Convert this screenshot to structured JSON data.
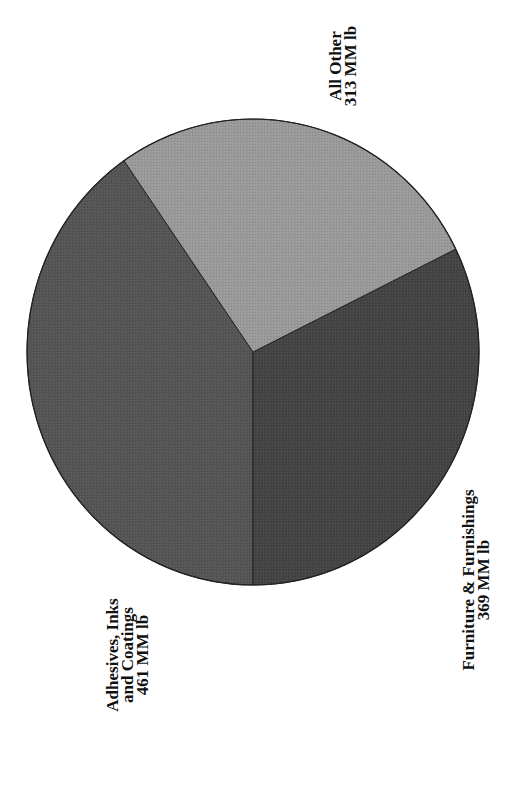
{
  "chart_data": {
    "type": "pie",
    "title": "",
    "orientation": "rotated 90 degrees counter-clockwise",
    "unit": "MM lb",
    "categories": [
      "Adhesives, Inks and Coatings",
      "Furniture & Furnishings",
      "All Other"
    ],
    "values": [
      461,
      369,
      313
    ],
    "total": 1143,
    "colors": [
      "#555555",
      "#444444",
      "#9a9a9a"
    ],
    "slices": [
      {
        "name": "Adhesives, Inks and Coatings",
        "value": 461,
        "label_lines": [
          "Adhesives, Inks",
          "and Coatings",
          "461 MM lb"
        ],
        "color": "#555555"
      },
      {
        "name": "Furniture & Furnishings",
        "value": 369,
        "label_lines": [
          "Furniture & Furnishings",
          "369 MM lb"
        ],
        "color": "#444444"
      },
      {
        "name": "All Other",
        "value": 313,
        "label_lines": [
          "All Other",
          "313 MM lb"
        ],
        "color": "#9a9a9a"
      }
    ],
    "legend": "none (labels placed next to slices)"
  },
  "labels": {
    "adhesives": {
      "line1": "Adhesives, Inks",
      "line2": "and Coatings",
      "line3": "461 MM lb"
    },
    "furniture": {
      "line1": "Furniture & Furnishings",
      "line2": "369 MM lb"
    },
    "other": {
      "line1": "All Other",
      "line2": "313 MM lb"
    }
  }
}
